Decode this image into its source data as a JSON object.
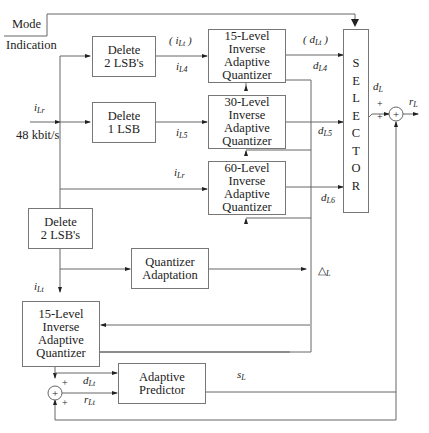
{
  "mode": {
    "line1": "Mode",
    "line2": "Indication"
  },
  "input": {
    "signal": "i",
    "signal_sub": "Lr",
    "rate": "48 kbit/s"
  },
  "blocks": {
    "delete2_top": "Delete\n2 LSB's",
    "delete1": "Delete\n1 LSB",
    "iaq15_top": "15-Level\nInverse\nAdaptive\nQuantizer",
    "iaq30": "30-Level\nInverse\nAdaptive\nQuantizer",
    "iaq60": "60-Level\nInverse\nAdaptive\nQuantizer",
    "delete2_bottom": "Delete\n2 LSB's",
    "quant_adapt": "Quantizer\nAdaptation",
    "iaq15_bottom": "15-Level\nInverse\nAdaptive\nQuantizer",
    "predictor": "Adaptive\nPredictor"
  },
  "selector": {
    "letters": [
      "S",
      "E",
      "L",
      "E",
      "C",
      "T",
      "O",
      "R"
    ]
  },
  "signals": {
    "iLt_paren": {
      "main": "( i",
      "sub": "Lt",
      "close": " )"
    },
    "iL4": {
      "main": "i",
      "sub": "L4"
    },
    "iL5": {
      "main": "i",
      "sub": "L5"
    },
    "iLr_mid": {
      "main": "i",
      "sub": "Lr"
    },
    "dLt_paren": {
      "main": "( d",
      "sub": "Lt",
      "close": " )"
    },
    "dL4": {
      "main": "d",
      "sub": "L4"
    },
    "dL5": {
      "main": "d",
      "sub": "L5"
    },
    "dL6": {
      "main": "d",
      "sub": "L6"
    },
    "dL": {
      "main": "d",
      "sub": "L"
    },
    "rL": {
      "main": "r",
      "sub": "L"
    },
    "iLt": {
      "main": "i",
      "sub": "Lt"
    },
    "deltaL": {
      "main": "△",
      "sub": "L"
    },
    "sL": {
      "main": "s",
      "sub": "L"
    },
    "dLt": {
      "main": "d",
      "sub": "Lt"
    },
    "rLt": {
      "main": "r",
      "sub": "Lt"
    }
  },
  "adder": {
    "plus": "+",
    "symbol": "+"
  }
}
